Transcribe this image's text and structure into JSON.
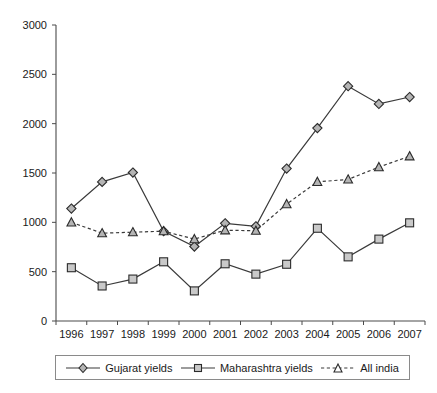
{
  "chart_data": {
    "type": "line",
    "title": "",
    "xlabel": "",
    "ylabel": "",
    "ylim": [
      0,
      3000
    ],
    "yticks": [
      0,
      500,
      1000,
      1500,
      2000,
      2500,
      3000
    ],
    "grid": false,
    "legend_position": "bottom",
    "categories": [
      "1996",
      "1997",
      "1998",
      "1999",
      "2000",
      "2001",
      "2002",
      "2003",
      "2004",
      "2005",
      "2006",
      "2007"
    ],
    "series": [
      {
        "name": "Gujarat yields",
        "marker": "diamond",
        "linestyle": "solid",
        "values": [
          1140,
          1410,
          1505,
          910,
          755,
          990,
          960,
          1545,
          1955,
          2380,
          2200,
          2270
        ]
      },
      {
        "name": "Maharashtra yields",
        "marker": "square",
        "linestyle": "solid",
        "values": [
          540,
          355,
          425,
          600,
          305,
          580,
          475,
          575,
          940,
          650,
          830,
          995
        ]
      },
      {
        "name": "All india",
        "marker": "triangle",
        "linestyle": "dashed",
        "values": [
          1000,
          890,
          900,
          910,
          830,
          920,
          915,
          1185,
          1410,
          1435,
          1560,
          1670
        ]
      }
    ]
  },
  "legend": {
    "items": [
      {
        "label": "Gujarat yields",
        "marker": "diamond-marker",
        "linestyle": "solid"
      },
      {
        "label": "Maharashtra yields",
        "marker": "square-marker",
        "linestyle": "solid"
      },
      {
        "label": "All india",
        "marker": "triangle-marker",
        "linestyle": "dashed"
      }
    ]
  },
  "colors": {
    "line": "#3a3a3a",
    "axis": "#4a4a4a",
    "marker_fill": "#b5b5b5",
    "marker_stroke": "#2b2b2b",
    "text": "#1a1a1a",
    "background": "#ffffff"
  }
}
